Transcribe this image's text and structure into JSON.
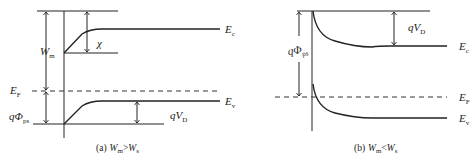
{
  "panel_a": {
    "caption_prefix": "(a)",
    "caption_w1": "W",
    "caption_w1_sub": "m",
    "caption_op": ">",
    "caption_w2": "W",
    "caption_w2_sub": "s",
    "label_Wm": "W",
    "label_Wm_sub": "m",
    "label_chi": "χ",
    "label_EF": "E",
    "label_EF_sub": "F",
    "label_qPhi": "qΦ",
    "label_qPhi_sub": "ps",
    "label_Ec": "E",
    "label_Ec_sub": "c",
    "label_Ev": "E",
    "label_Ev_sub": "v",
    "label_qVD": "qV",
    "label_qVD_sub": "D"
  },
  "panel_b": {
    "caption_prefix": "(b)",
    "caption_w1": "W",
    "caption_w1_sub": "m",
    "caption_op": "<",
    "caption_w2": "W",
    "caption_w2_sub": "s",
    "label_qPhi": "qΦ",
    "label_qPhi_sub": "ps",
    "label_qVD": "qV",
    "label_qVD_sub": "D",
    "label_Ec": "E",
    "label_Ec_sub": "c",
    "label_EF": "E",
    "label_EF_sub": "F",
    "label_Ev": "E",
    "label_Ev_sub": "v"
  }
}
